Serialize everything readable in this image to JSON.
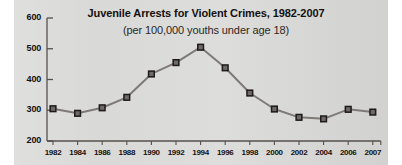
{
  "chart_data": {
    "type": "line",
    "title": "Juvenile Arrests for Violent Crimes, 1982-2007",
    "subtitle": "(per 100,000 youths under age 18)",
    "xlabel": "",
    "ylabel": "",
    "ylim": [
      200,
      600
    ],
    "yticks": [
      200,
      300,
      400,
      500,
      600
    ],
    "ytick_labels": [
      "200",
      "300",
      "400",
      "500",
      "600"
    ],
    "grid": false,
    "legend": null,
    "marker": "square",
    "categories": [
      "1982",
      "1984",
      "1986",
      "1988",
      "1990",
      "1992",
      "1994",
      "1996",
      "1998",
      "2000",
      "2002",
      "2004",
      "2006",
      "2007"
    ],
    "x": [
      1982,
      1984,
      1986,
      1988,
      1990,
      1992,
      1994,
      1996,
      1998,
      2000,
      2002,
      2004,
      2006,
      2007
    ],
    "values": [
      305,
      290,
      308,
      342,
      418,
      455,
      505,
      438,
      356,
      304,
      277,
      272,
      303,
      294
    ],
    "series": [
      {
        "name": "Juvenile arrest rate for violent crimes",
        "values": [
          305,
          290,
          308,
          342,
          418,
          455,
          505,
          438,
          356,
          304,
          277,
          272,
          303,
          294
        ]
      }
    ]
  },
  "colors": {
    "plate_background": "#d9d9d7",
    "page_background": "#ffffff",
    "axis": "#55504d",
    "line": "#7e7a77",
    "marker_fill": "#6e6a67",
    "marker_edge": "#1d1a18",
    "title_text": "#14100f",
    "label_text": "#14100f"
  }
}
